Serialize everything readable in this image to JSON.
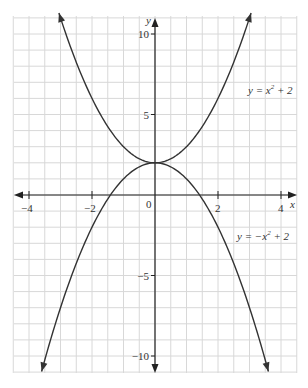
{
  "chart_data": {
    "type": "line",
    "title": "",
    "xlabel": "x",
    "ylabel": "y",
    "xlim": [
      -4.5,
      4.5
    ],
    "ylim": [
      -11,
      11
    ],
    "grid": true,
    "x_ticks": [
      -4,
      -2,
      0,
      2,
      4
    ],
    "x_tick_labels": [
      "−4",
      "−2",
      "0",
      "2",
      "4"
    ],
    "y_ticks": [
      10,
      5,
      -5,
      -10
    ],
    "y_tick_labels": [
      "10",
      "5",
      "−5",
      "−10"
    ],
    "series": [
      {
        "name": "y = x² + 2",
        "formula": "x^2+2",
        "x_range": [
          -3.05,
          3.05
        ],
        "color": "#333333"
      },
      {
        "name": "y = −x² + 2",
        "formula": "-x^2+2",
        "x_range": [
          -3.6,
          3.6
        ],
        "color": "#333333"
      }
    ],
    "annotations": [
      {
        "text": "y = x² + 2",
        "near_series": 0
      },
      {
        "text": "y = −x² + 2",
        "near_series": 1
      }
    ]
  },
  "labels": {
    "x_axis": "x",
    "y_axis": "y",
    "eq1_main": "y = x",
    "eq1_sup": "2",
    "eq1_tail": " + 2",
    "eq2_main": "y = −x",
    "eq2_sup": "2",
    "eq2_tail": " + 2"
  }
}
